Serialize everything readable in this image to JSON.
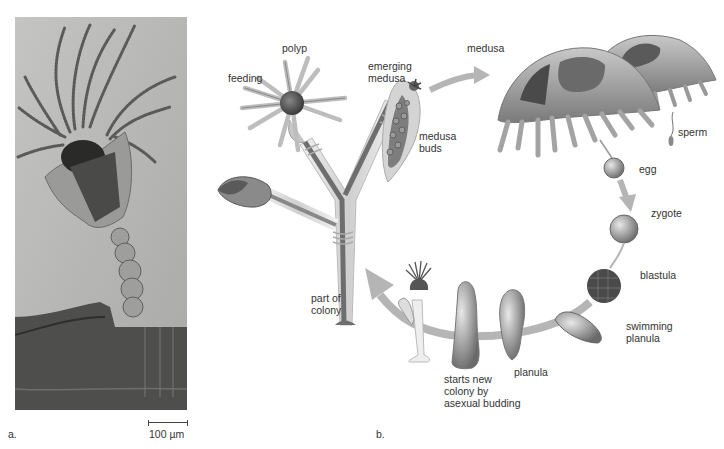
{
  "figure": {
    "panel_a": {
      "letter": "a.",
      "description": "Micrograph of polyp",
      "scale_bar": "100 µm"
    },
    "panel_b": {
      "letter": "b.",
      "labels": {
        "polyp": "polyp",
        "feeding": "feeding",
        "emerging_medusa_1": "emerging",
        "emerging_medusa_2": "medusa",
        "medusa_buds_1": "medusa",
        "medusa_buds_2": "buds",
        "medusa": "medusa",
        "sperm": "sperm",
        "egg": "egg",
        "zygote": "zygote",
        "blastula": "blastula",
        "swimming_planula_1": "swimming",
        "swimming_planula_2": "planula",
        "planula": "planula",
        "starts_new_1": "starts new",
        "starts_new_2": "colony by",
        "starts_new_3": "asexual budding",
        "part_of_colony_1": "part of",
        "part_of_colony_2": "colony"
      }
    }
  },
  "colors": {
    "micrograph_bg": "#b8b8b6",
    "arrow": "#b0b0b0",
    "tissue": "#8a8a8a",
    "dark_tissue": "#555555",
    "text": "#333333"
  }
}
